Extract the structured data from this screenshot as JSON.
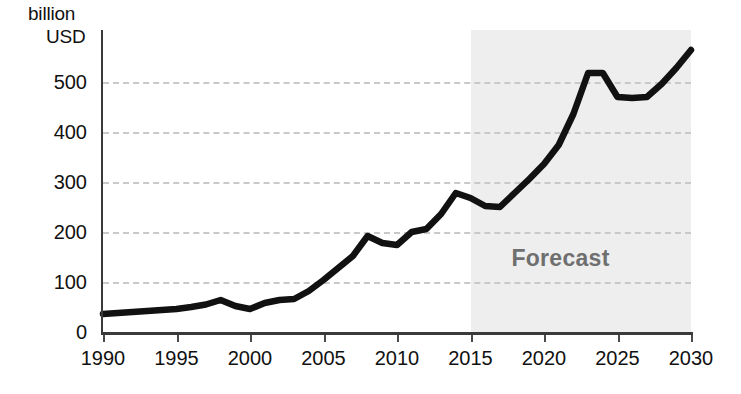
{
  "chart_data": {
    "type": "line",
    "title": "",
    "subtitle": "",
    "unit_caption": {
      "line1": "billion",
      "line2": "USD"
    },
    "xlabel": "",
    "ylabel": "billion USD",
    "xlim": [
      1990,
      2030
    ],
    "ylim": [
      0,
      570
    ],
    "grid": true,
    "grid_axis": "y",
    "grid_style": "dashed",
    "legend": "none",
    "y_ticks": [
      0,
      100,
      200,
      300,
      400,
      500
    ],
    "y_tick_labels": [
      "0",
      "100",
      "200",
      "300",
      "400",
      "500"
    ],
    "x_ticks": [
      1990,
      1995,
      2000,
      2005,
      2010,
      2015,
      2020,
      2025,
      2030
    ],
    "x_tick_labels": [
      "1990",
      "1995",
      "2000",
      "2005",
      "2010",
      "2015",
      "2020",
      "2025",
      "2030"
    ],
    "annotations": [
      {
        "name": "forecast-region",
        "text": "Forecast",
        "x_start": 2015,
        "x_end": 2030,
        "label_x": 2022,
        "label_y": 142,
        "fill": "#eeeeee",
        "text_color": "#6f6f6f"
      }
    ],
    "series": [
      {
        "name": "Market size",
        "color": "#111111",
        "x": [
          1990,
          1991,
          1992,
          1993,
          1994,
          1995,
          1996,
          1997,
          1998,
          1999,
          2000,
          2001,
          2002,
          2003,
          2004,
          2005,
          2006,
          2007,
          2008,
          2009,
          2010,
          2011,
          2012,
          2013,
          2014,
          2015,
          2016,
          2017,
          2018,
          2019,
          2020,
          2021,
          2022,
          2023,
          2024,
          2025,
          2026,
          2027,
          2028,
          2029,
          2030
        ],
        "values": [
          36,
          38,
          40,
          42,
          44,
          46,
          50,
          55,
          64,
          52,
          46,
          58,
          64,
          66,
          82,
          104,
          128,
          152,
          192,
          178,
          174,
          200,
          206,
          236,
          278,
          268,
          252,
          250,
          278,
          306,
          336,
          374,
          436,
          518,
          518,
          470,
          468,
          470,
          496,
          528,
          564
        ]
      }
    ]
  }
}
